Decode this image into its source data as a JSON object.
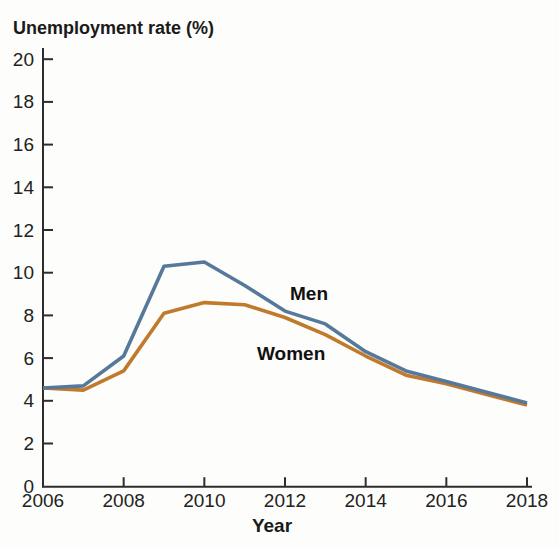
{
  "figure": {
    "title": "Unemployment rate (%)",
    "x_axis_title": "Year"
  },
  "colors": {
    "men_line": "#56799b",
    "women_line": "#c07a2c",
    "axis": "#2d2d2d",
    "text": "#1a1a1a",
    "background": "#fdfdfb"
  },
  "chart_data": {
    "type": "line",
    "title": "Unemployment rate (%)",
    "xlabel": "Year",
    "ylabel": "Unemployment rate (%)",
    "x": [
      2006,
      2007,
      2008,
      2009,
      2010,
      2011,
      2012,
      2013,
      2014,
      2015,
      2016,
      2017,
      2018
    ],
    "series": [
      {
        "name": "Men",
        "color": "#56799b",
        "values": [
          4.6,
          4.7,
          6.1,
          10.3,
          10.5,
          9.4,
          8.2,
          7.6,
          6.3,
          5.4,
          4.9,
          4.4,
          3.9
        ]
      },
      {
        "name": "Women",
        "color": "#c07a2c",
        "values": [
          4.6,
          4.5,
          5.4,
          8.1,
          8.6,
          8.5,
          7.9,
          7.1,
          6.1,
          5.2,
          4.8,
          4.3,
          3.8
        ]
      }
    ],
    "xticks": [
      "2006",
      "2008",
      "2010",
      "2012",
      "2014",
      "2016",
      "2018"
    ],
    "yticks": [
      "0",
      "2",
      "4",
      "6",
      "8",
      "10",
      "12",
      "14",
      "16",
      "18",
      "20"
    ],
    "xlim": [
      2006,
      2018
    ],
    "ylim": [
      0,
      20
    ],
    "grid": false,
    "legend": "inline-labels",
    "label_positions": {
      "Men": {
        "x": 290,
        "y": 300
      },
      "Women": {
        "x": 257,
        "y": 360
      }
    }
  }
}
